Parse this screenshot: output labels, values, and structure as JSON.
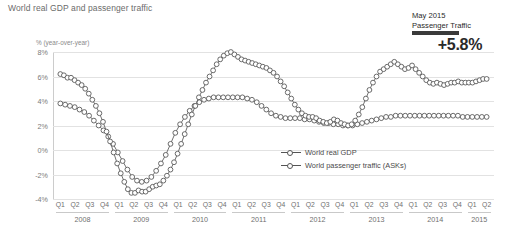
{
  "chart_title": "World real GDP and passenger traffic",
  "y_axis_title": "% (year-over-year)",
  "callout": {
    "line1": "May 2015",
    "line2": "Passenger Traffic",
    "value": "+5.8%",
    "bar_color": "#3a3a3a"
  },
  "legend": [
    {
      "label": "World real GDP"
    },
    {
      "label": "World passenger traffic (ASKs)"
    }
  ],
  "chart_data": {
    "type": "line",
    "title": "World real GDP and passenger traffic",
    "xlabel": "",
    "ylabel": "% (year-over-year)",
    "ylim": [
      -4,
      8
    ],
    "yticks": [
      8,
      6,
      4,
      2,
      0,
      -2,
      -4
    ],
    "ytick_labels": [
      "8%",
      "6%",
      "4%",
      "2%",
      "0%",
      "-2%",
      "-4%"
    ],
    "grid": true,
    "legend_position": "inside-lower-right",
    "quarter_labels": [
      "Q1",
      "Q2",
      "Q3",
      "Q4",
      "Q1",
      "Q2",
      "Q3",
      "Q4",
      "Q1",
      "Q2",
      "Q3",
      "Q4",
      "Q1",
      "Q2",
      "Q3",
      "Q4",
      "Q1",
      "Q2",
      "Q3",
      "Q4",
      "Q1",
      "Q2",
      "Q3",
      "Q4",
      "Q1",
      "Q2",
      "Q3",
      "Q4",
      "Q1",
      "Q2"
    ],
    "years": [
      {
        "label": "2008",
        "quarters": 4
      },
      {
        "label": "2009",
        "quarters": 4
      },
      {
        "label": "2010",
        "quarters": 4
      },
      {
        "label": "2011",
        "quarters": 4
      },
      {
        "label": "2012",
        "quarters": 4
      },
      {
        "label": "2013",
        "quarters": 4
      },
      {
        "label": "2014",
        "quarters": 4
      },
      {
        "label": "2015",
        "quarters": 2
      }
    ],
    "x": [
      "2008Q1",
      "2008Q2",
      "2008Q3",
      "2008Q4",
      "2009Q1",
      "2009Q2",
      "2009Q3",
      "2009Q4",
      "2010Q1",
      "2010Q2",
      "2010Q3",
      "2010Q4",
      "2011Q1",
      "2011Q2",
      "2011Q3",
      "2011Q4",
      "2012Q1",
      "2012Q2",
      "2012Q3",
      "2012Q4",
      "2013Q1",
      "2013Q2",
      "2013Q3",
      "2013Q4",
      "2014Q1",
      "2014Q2",
      "2014Q3",
      "2014Q4",
      "2015Q1",
      "2015Q2"
    ],
    "series": [
      {
        "name": "World real GDP",
        "monthly_values": [
          3.8,
          3.7,
          3.6,
          3.5,
          3.3,
          3.1,
          2.8,
          2.4,
          2.0,
          1.6,
          1.1,
          0.5,
          -0.2,
          -0.9,
          -1.6,
          -2.2,
          -2.5,
          -2.6,
          -2.5,
          -2.2,
          -1.7,
          -1.1,
          -0.4,
          0.5,
          1.4,
          2.1,
          2.7,
          3.2,
          3.6,
          3.9,
          4.1,
          4.2,
          4.3,
          4.3,
          4.3,
          4.3,
          4.3,
          4.3,
          4.3,
          4.2,
          4.1,
          3.9,
          3.6,
          3.3,
          3.0,
          2.8,
          2.7,
          2.6,
          2.6,
          2.6,
          2.6,
          2.5,
          2.5,
          2.4,
          2.3,
          2.2,
          2.2,
          2.1,
          2.1,
          2.0,
          2.0,
          2.0,
          2.1,
          2.2,
          2.3,
          2.4,
          2.5,
          2.6,
          2.7,
          2.7,
          2.8,
          2.8,
          2.8,
          2.8,
          2.8,
          2.8,
          2.8,
          2.8,
          2.8,
          2.8,
          2.8,
          2.8,
          2.8,
          2.8,
          2.7,
          2.7,
          2.7,
          2.7,
          2.7,
          2.7
        ]
      },
      {
        "name": "World passenger traffic (ASKs)",
        "monthly_values": [
          6.2,
          6.1,
          5.9,
          5.9,
          5.7,
          5.5,
          5.3,
          5.0,
          4.6,
          4.1,
          3.6,
          3.0,
          2.3,
          1.5,
          0.7,
          -0.2,
          -1.1,
          -1.9,
          -2.6,
          -3.2,
          -3.5,
          -3.5,
          -3.3,
          -3.4,
          -3.4,
          -3.2,
          -3.0,
          -2.9,
          -2.8,
          -2.5,
          -2.1,
          -1.6,
          -1.0,
          -0.3,
          0.5,
          1.3,
          2.1,
          2.9,
          3.6,
          4.3,
          4.9,
          5.5,
          6.0,
          6.5,
          7.0,
          7.4,
          7.7,
          7.9,
          8.0,
          7.8,
          7.6,
          7.4,
          7.3,
          7.2,
          7.1,
          7.0,
          6.9,
          6.8,
          6.7,
          6.5,
          6.3,
          6.0,
          5.6,
          5.2,
          4.7,
          4.2,
          3.7,
          3.3,
          3.0,
          2.8,
          2.7,
          2.7,
          2.6,
          2.4,
          2.3,
          2.2,
          2.3,
          2.5,
          2.4,
          2.2,
          2.1,
          2.0,
          2.1,
          2.4,
          2.9,
          3.5,
          4.2,
          4.9,
          5.5,
          6.0,
          6.4,
          6.6,
          6.8,
          7.0,
          7.2,
          7.0,
          6.8,
          6.6,
          6.7,
          6.9,
          6.6,
          6.3,
          6.0,
          5.7,
          5.5,
          5.4,
          5.5,
          5.4,
          5.3,
          5.4,
          5.5,
          5.5,
          5.6,
          5.5,
          5.5,
          5.5,
          5.5,
          5.6,
          5.7,
          5.8,
          5.8
        ]
      }
    ]
  }
}
